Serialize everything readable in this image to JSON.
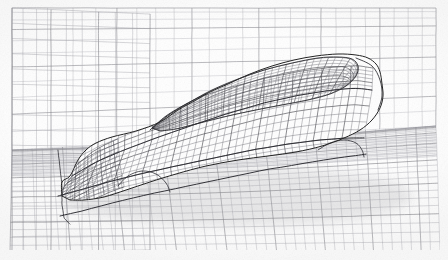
{
  "figure": {
    "kind": "cfd-surface-mesh-wireframe",
    "domain_label": "rectangular wind-tunnel computational domain",
    "view": "low front three-quarter view from driver side",
    "render_style": "hidden-line removed structured quad wireframe, grayscale line art",
    "background_color": "#ffffff",
    "line_color": "#3a3a3a",
    "line_color_light": "#8e8e8e",
    "line_color_faint": "#b9b9bd",
    "silhouette_color": "#1d1d1d",
    "canvas": {
      "width": 448,
      "height": 260
    }
  },
  "chart_data": {
    "type": "line",
    "title": "Structured surface mesh of a vehicle in a wind-tunnel domain",
    "xlabel": "",
    "ylabel": "",
    "grid": true,
    "legend": "none",
    "regions": [
      {
        "name": "far-wall",
        "u_lines": 26,
        "v_lines": 14,
        "shade": "faint"
      },
      {
        "name": "ground-plane",
        "u_lines": 46,
        "v_lines": 30,
        "shade": "light"
      },
      {
        "name": "vehicle-body",
        "u_lines": 40,
        "v_lines": 26,
        "shade": "dark"
      }
    ]
  },
  "plot_frame": {
    "x": 8,
    "y": 6,
    "width": 432,
    "height": 244,
    "inset_border": false
  },
  "domain_box": {
    "name": "wind-tunnel-domain",
    "back_wall": {
      "quad": [
        [
          12,
          8
        ],
        [
          436,
          8
        ],
        [
          436,
          126
        ],
        [
          12,
          150
        ]
      ],
      "columns": 24,
      "rows": 11
    },
    "side_wall": {
      "quad": [
        [
          12,
          8
        ],
        [
          150,
          14
        ],
        [
          150,
          250
        ],
        [
          12,
          252
        ]
      ],
      "columns": 9,
      "rows": 16
    },
    "floor": {
      "quad": [
        [
          12,
          150
        ],
        [
          436,
          126
        ],
        [
          440,
          252
        ],
        [
          10,
          254
        ]
      ],
      "streamwise_lines": 28,
      "spanwise_lines": 42
    }
  },
  "vehicle": {
    "name": "vehicle-surface",
    "parts": [
      {
        "id": "hood",
        "label": "hood / bonnet"
      },
      {
        "id": "windshield",
        "label": "windshield"
      },
      {
        "id": "roof",
        "label": "roof"
      },
      {
        "id": "a-pillar",
        "label": "A-pillar"
      },
      {
        "id": "side-body",
        "label": "side body panel"
      },
      {
        "id": "front-fascia",
        "label": "front fascia"
      },
      {
        "id": "bumper",
        "label": "front bumper"
      },
      {
        "id": "lower-skirt",
        "label": "lower rocker skirt"
      },
      {
        "id": "wheel-arch",
        "label": "wheel arch"
      },
      {
        "id": "underbody",
        "label": "underbody shadow"
      }
    ],
    "silhouette": [
      [
        62,
        196
      ],
      [
        62,
        182
      ],
      [
        70,
        176
      ],
      [
        78,
        160
      ],
      [
        86,
        150
      ],
      [
        96,
        143
      ],
      [
        112,
        137
      ],
      [
        136,
        131
      ],
      [
        160,
        122
      ],
      [
        178,
        110
      ],
      [
        196,
        100
      ],
      [
        210,
        92
      ],
      [
        228,
        84
      ],
      [
        250,
        74
      ],
      [
        272,
        66
      ],
      [
        294,
        60
      ],
      [
        316,
        56
      ],
      [
        338,
        54
      ],
      [
        356,
        55
      ],
      [
        368,
        58
      ],
      [
        376,
        64
      ],
      [
        380,
        72
      ],
      [
        382,
        84
      ],
      [
        383,
        96
      ],
      [
        380,
        108
      ],
      [
        372,
        120
      ],
      [
        360,
        130
      ],
      [
        344,
        138
      ],
      [
        322,
        146
      ],
      [
        296,
        152
      ],
      [
        268,
        156
      ],
      [
        238,
        160
      ],
      [
        206,
        166
      ],
      [
        176,
        174
      ],
      [
        150,
        182
      ],
      [
        126,
        190
      ],
      [
        104,
        197
      ],
      [
        84,
        200
      ],
      [
        70,
        200
      ]
    ],
    "greenhouse": [
      [
        152,
        128
      ],
      [
        170,
        114
      ],
      [
        190,
        102
      ],
      [
        212,
        90
      ],
      [
        238,
        79
      ],
      [
        264,
        70
      ],
      [
        292,
        63
      ],
      [
        318,
        58
      ],
      [
        338,
        57
      ],
      [
        352,
        59
      ],
      [
        358,
        66
      ],
      [
        356,
        76
      ],
      [
        346,
        86
      ],
      [
        330,
        94
      ],
      [
        308,
        100
      ],
      [
        282,
        105
      ],
      [
        256,
        110
      ],
      [
        228,
        116
      ],
      [
        200,
        123
      ],
      [
        176,
        129
      ],
      [
        160,
        131
      ]
    ],
    "beltline": [
      [
        72,
        176
      ],
      [
        96,
        162
      ],
      [
        124,
        150
      ],
      [
        156,
        138
      ],
      [
        190,
        126
      ],
      [
        226,
        114
      ],
      [
        264,
        103
      ],
      [
        300,
        95
      ],
      [
        332,
        90
      ],
      [
        356,
        88
      ],
      [
        372,
        90
      ]
    ],
    "bumper_band": [
      [
        58,
        196
      ],
      [
        80,
        190
      ],
      [
        108,
        182
      ],
      [
        140,
        174
      ],
      [
        176,
        166
      ],
      [
        214,
        158
      ],
      [
        252,
        150
      ],
      [
        288,
        144
      ],
      [
        320,
        140
      ],
      [
        346,
        138
      ],
      [
        364,
        138
      ]
    ],
    "lower_skirt": [
      [
        60,
        216
      ],
      [
        86,
        210
      ],
      [
        116,
        202
      ],
      [
        150,
        194
      ],
      [
        188,
        186
      ],
      [
        226,
        178
      ],
      [
        264,
        170
      ],
      [
        300,
        164
      ],
      [
        330,
        159
      ],
      [
        352,
        156
      ],
      [
        366,
        154
      ]
    ],
    "front_face": [
      [
        58,
        150
      ],
      [
        60,
        168
      ],
      [
        62,
        186
      ],
      [
        62,
        204
      ],
      [
        64,
        218
      ],
      [
        70,
        224
      ]
    ],
    "shadow_ellipse": {
      "cx": 236,
      "cy": 196,
      "rx": 176,
      "ry": 30
    }
  },
  "mesh_params": {
    "body_u_count": 44,
    "body_v_count": 22,
    "wall_v_count": 24,
    "floor_u_count": 30,
    "floor_v_count": 46,
    "line_width_thin": 0.4,
    "line_width_mid": 0.55,
    "line_width_edge": 0.9
  },
  "annotations": []
}
